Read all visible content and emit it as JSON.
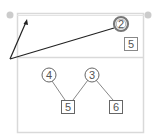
{
  "canvas": {
    "width": 159,
    "height": 140,
    "background": "#ffffff"
  },
  "colors": {
    "frame": "#d9d9d9",
    "node_stroke": "#666666",
    "arrow": "#222222",
    "handle": "#cccccc",
    "text": "#555555"
  },
  "top_panel": {
    "nodes": [
      {
        "id": "circle-2",
        "shape": "double-circle",
        "label": "2"
      },
      {
        "id": "square-5-top",
        "shape": "square",
        "label": "5"
      }
    ]
  },
  "bottom_panel": {
    "nodes": [
      {
        "id": "circle-4",
        "shape": "circle",
        "label": "4"
      },
      {
        "id": "circle-3",
        "shape": "circle",
        "label": "3"
      },
      {
        "id": "square-5",
        "shape": "square",
        "label": "5"
      },
      {
        "id": "square-6",
        "shape": "square",
        "label": "6"
      }
    ],
    "edges": [
      {
        "from": "4",
        "to": "5"
      },
      {
        "from": "3",
        "to": "5"
      },
      {
        "from": "3",
        "to": "6"
      }
    ]
  }
}
